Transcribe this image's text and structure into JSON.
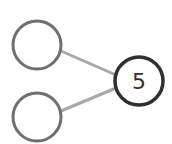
{
  "diagram": {
    "colors": {
      "background": "#ffffff",
      "input_stroke": "#707070",
      "edge_stroke": "#a8a8a8",
      "output_stroke": "#303030",
      "label": "#303030"
    },
    "nodes": [
      {
        "id": "input-top",
        "label": ""
      },
      {
        "id": "input-bottom",
        "label": ""
      },
      {
        "id": "output",
        "label": "5"
      }
    ],
    "edges": [
      {
        "from": "input-top",
        "to": "output"
      },
      {
        "from": "input-bottom",
        "to": "output"
      }
    ]
  }
}
